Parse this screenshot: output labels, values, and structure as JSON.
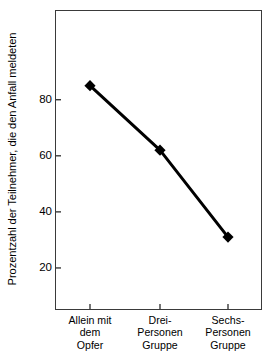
{
  "chart_data": {
    "type": "line",
    "title": "",
    "subtitle": "",
    "xlabel": "",
    "ylabel": "Prozentzahl der Teilnehmer, die den Anfall meldeten",
    "categories": [
      "Allein mit dem Opfer",
      "Drei-Personen Gruppe",
      "Sechs-Personen Gruppe"
    ],
    "category_lines": [
      [
        "Allein mit",
        "dem",
        "Opfer"
      ],
      [
        "Drei-",
        "Personen",
        "Gruppe"
      ],
      [
        "Sechs-",
        "Personen",
        "Gruppe"
      ]
    ],
    "values": [
      85,
      62,
      31
    ],
    "series": [
      {
        "name": "Prozentzahl der Teilnehmer, die den Anfall meldeten",
        "values": [
          85,
          62,
          31
        ]
      }
    ],
    "ylim": [
      5,
      112
    ],
    "yticks": [
      20,
      40,
      60,
      80
    ],
    "ytick_labels": [
      "20",
      "40",
      "60",
      "80"
    ],
    "xtick_positions": [
      90,
      160,
      228
    ],
    "grid": false,
    "legend": false,
    "legend_position": "none",
    "marker": "diamond",
    "marker_color": "#000000",
    "line_color": "#000000",
    "line_width": 3,
    "background_color": "#ffffff",
    "frame_color": "#3a3a3a"
  }
}
